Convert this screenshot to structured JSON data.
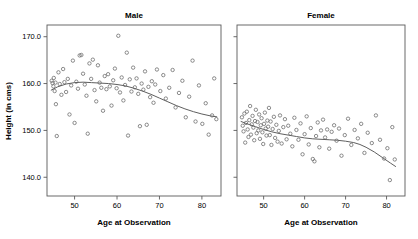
{
  "chart_data": {
    "type": "scatter",
    "title": "",
    "xlabel": "Age at Observation",
    "ylabel": "Height (in cms)",
    "xlim": [
      43.5,
      84.5
    ],
    "ylim": [
      136.0,
      172.5
    ],
    "xticks": [
      50,
      60,
      70,
      80
    ],
    "xtick_labels": [
      "50",
      "60",
      "70",
      "80"
    ],
    "yticks": [
      140.0,
      150.0,
      160.0,
      170.0
    ],
    "ytick_labels": [
      "140.0",
      "150.0",
      "160.0",
      "170.0"
    ],
    "grid": false,
    "legend": "none",
    "marker": "open-circle",
    "marker_color": "#6e6e6e",
    "trend_color": "#5f5f5f",
    "frame_color": "#5a5a5a",
    "panels": [
      {
        "name": "male",
        "label": "Male",
        "show_y_tick_labels": true,
        "points": [
          [
            44.6,
            160.6
          ],
          [
            44.8,
            160.1
          ],
          [
            45.0,
            159.4
          ],
          [
            45.1,
            161.2
          ],
          [
            45.3,
            158.4
          ],
          [
            45.5,
            160.2
          ],
          [
            45.6,
            155.6
          ],
          [
            45.8,
            148.8
          ],
          [
            46.2,
            162.4
          ],
          [
            46.5,
            159.9
          ],
          [
            46.9,
            157.6
          ],
          [
            47.3,
            163.1
          ],
          [
            47.6,
            160.3
          ],
          [
            48.0,
            158.2
          ],
          [
            48.4,
            161.0
          ],
          [
            48.8,
            153.4
          ],
          [
            49.2,
            159.6
          ],
          [
            49.6,
            164.9
          ],
          [
            50.0,
            151.6
          ],
          [
            50.4,
            160.4
          ],
          [
            50.8,
            158.9
          ],
          [
            51.2,
            166.0
          ],
          [
            51.6,
            166.1
          ],
          [
            52.0,
            162.1
          ],
          [
            52.4,
            159.8
          ],
          [
            52.8,
            157.4
          ],
          [
            53.1,
            149.3
          ],
          [
            53.5,
            164.3
          ],
          [
            53.9,
            161.0
          ],
          [
            54.3,
            165.1
          ],
          [
            54.7,
            158.6
          ],
          [
            55.1,
            156.2
          ],
          [
            55.5,
            163.9
          ],
          [
            55.9,
            160.2
          ],
          [
            56.3,
            159.1
          ],
          [
            56.7,
            154.2
          ],
          [
            57.1,
            161.6
          ],
          [
            57.5,
            158.8
          ],
          [
            57.9,
            162.0
          ],
          [
            58.3,
            159.4
          ],
          [
            58.7,
            155.3
          ],
          [
            59.1,
            160.7
          ],
          [
            59.5,
            163.2
          ],
          [
            59.9,
            159.0
          ],
          [
            60.3,
            170.2
          ],
          [
            60.7,
            158.1
          ],
          [
            61.1,
            161.3
          ],
          [
            61.5,
            156.4
          ],
          [
            61.9,
            159.7
          ],
          [
            62.3,
            166.6
          ],
          [
            62.6,
            148.9
          ],
          [
            63.0,
            160.9
          ],
          [
            63.4,
            158.3
          ],
          [
            63.8,
            163.4
          ],
          [
            64.2,
            159.2
          ],
          [
            64.6,
            161.1
          ],
          [
            65.0,
            157.8
          ],
          [
            65.4,
            150.9
          ],
          [
            65.8,
            160.0
          ],
          [
            66.2,
            158.7
          ],
          [
            66.6,
            162.6
          ],
          [
            67.0,
            151.2
          ],
          [
            67.4,
            159.3
          ],
          [
            67.8,
            157.1
          ],
          [
            68.2,
            160.5
          ],
          [
            68.6,
            155.9
          ],
          [
            69.0,
            159.8
          ],
          [
            69.4,
            163.0
          ],
          [
            70.2,
            158.4
          ],
          [
            70.9,
            161.8
          ],
          [
            71.5,
            156.8
          ],
          [
            72.3,
            159.1
          ],
          [
            73.1,
            162.9
          ],
          [
            73.8,
            154.9
          ],
          [
            74.6,
            158.0
          ],
          [
            75.4,
            160.6
          ],
          [
            76.2,
            152.8
          ],
          [
            77.0,
            157.2
          ],
          [
            77.8,
            164.9
          ],
          [
            78.5,
            151.9
          ],
          [
            79.3,
            159.6
          ],
          [
            80.1,
            151.4
          ],
          [
            80.9,
            155.8
          ],
          [
            81.6,
            149.1
          ],
          [
            82.4,
            153.2
          ],
          [
            82.9,
            161.1
          ],
          [
            83.4,
            152.4
          ]
        ],
        "trend": [
          [
            44.5,
            158.6
          ],
          [
            46.0,
            159.3
          ],
          [
            48.0,
            159.9
          ],
          [
            50.0,
            160.2
          ],
          [
            52.0,
            160.3
          ],
          [
            54.0,
            160.2
          ],
          [
            56.0,
            160.1
          ],
          [
            58.0,
            160.0
          ],
          [
            60.0,
            159.8
          ],
          [
            62.0,
            159.5
          ],
          [
            64.0,
            159.0
          ],
          [
            66.0,
            158.4
          ],
          [
            68.0,
            157.7
          ],
          [
            70.0,
            156.9
          ],
          [
            72.0,
            156.1
          ],
          [
            74.0,
            155.3
          ],
          [
            76.0,
            154.6
          ],
          [
            78.0,
            154.0
          ],
          [
            80.0,
            153.5
          ],
          [
            82.0,
            153.1
          ],
          [
            83.5,
            152.9
          ]
        ]
      },
      {
        "name": "female",
        "label": "Female",
        "show_y_tick_labels": false,
        "points": [
          [
            44.7,
            152.8
          ],
          [
            44.9,
            151.0
          ],
          [
            45.1,
            149.8
          ],
          [
            45.3,
            153.6
          ],
          [
            45.5,
            147.4
          ],
          [
            45.7,
            151.6
          ],
          [
            45.9,
            154.0
          ],
          [
            46.1,
            150.2
          ],
          [
            46.3,
            148.6
          ],
          [
            46.5,
            152.2
          ],
          [
            46.7,
            155.2
          ],
          [
            46.9,
            149.1
          ],
          [
            47.1,
            151.3
          ],
          [
            47.3,
            153.1
          ],
          [
            47.5,
            150.6
          ],
          [
            47.7,
            147.9
          ],
          [
            47.9,
            152.0
          ],
          [
            48.1,
            154.4
          ],
          [
            48.3,
            149.4
          ],
          [
            48.5,
            151.8
          ],
          [
            48.7,
            150.0
          ],
          [
            48.9,
            153.4
          ],
          [
            49.1,
            148.2
          ],
          [
            49.3,
            151.1
          ],
          [
            49.5,
            152.6
          ],
          [
            49.7,
            149.6
          ],
          [
            49.9,
            147.1
          ],
          [
            50.1,
            151.4
          ],
          [
            50.3,
            153.8
          ],
          [
            50.5,
            150.4
          ],
          [
            50.7,
            148.9
          ],
          [
            50.9,
            152.1
          ],
          [
            51.1,
            150.8
          ],
          [
            51.3,
            154.8
          ],
          [
            51.5,
            149.0
          ],
          [
            51.7,
            151.9
          ],
          [
            51.9,
            146.9
          ],
          [
            52.2,
            150.3
          ],
          [
            52.5,
            152.9
          ],
          [
            52.8,
            148.4
          ],
          [
            53.1,
            151.2
          ],
          [
            53.4,
            147.6
          ],
          [
            53.7,
            149.9
          ],
          [
            54.0,
            153.2
          ],
          [
            54.4,
            147.2
          ],
          [
            54.8,
            150.7
          ],
          [
            55.2,
            152.4
          ],
          [
            55.6,
            148.1
          ],
          [
            56.0,
            151.0
          ],
          [
            56.5,
            149.3
          ],
          [
            57.0,
            146.6
          ],
          [
            57.5,
            152.7
          ],
          [
            58.0,
            150.1
          ],
          [
            58.5,
            148.0
          ],
          [
            59.0,
            151.5
          ],
          [
            59.5,
            144.9
          ],
          [
            60.0,
            149.2
          ],
          [
            60.5,
            153.0
          ],
          [
            61.0,
            147.0
          ],
          [
            61.5,
            150.5
          ],
          [
            62.0,
            143.9
          ],
          [
            62.4,
            143.4
          ],
          [
            62.8,
            148.8
          ],
          [
            63.2,
            151.7
          ],
          [
            63.6,
            146.4
          ],
          [
            64.0,
            150.0
          ],
          [
            64.5,
            152.3
          ],
          [
            65.0,
            148.5
          ],
          [
            65.5,
            150.2
          ],
          [
            66.0,
            146.1
          ],
          [
            66.6,
            149.7
          ],
          [
            67.2,
            151.1
          ],
          [
            67.8,
            147.8
          ],
          [
            68.4,
            150.4
          ],
          [
            69.0,
            144.6
          ],
          [
            69.8,
            149.0
          ],
          [
            70.6,
            152.5
          ],
          [
            71.4,
            146.9
          ],
          [
            72.2,
            150.1
          ],
          [
            73.0,
            148.3
          ],
          [
            73.8,
            151.4
          ],
          [
            74.6,
            145.2
          ],
          [
            75.4,
            149.5
          ],
          [
            76.4,
            147.3
          ],
          [
            77.4,
            153.2
          ],
          [
            78.4,
            148.0
          ],
          [
            79.4,
            144.0
          ],
          [
            80.2,
            146.2
          ],
          [
            80.8,
            139.4
          ],
          [
            81.4,
            150.7
          ],
          [
            82.0,
            143.8
          ]
        ],
        "trend": [
          [
            44.5,
            151.9
          ],
          [
            46.0,
            151.4
          ],
          [
            48.0,
            150.8
          ],
          [
            50.0,
            150.2
          ],
          [
            52.0,
            149.7
          ],
          [
            54.0,
            149.3
          ],
          [
            56.0,
            149.0
          ],
          [
            58.0,
            148.7
          ],
          [
            60.0,
            148.4
          ],
          [
            62.0,
            148.2
          ],
          [
            64.0,
            148.1
          ],
          [
            66.0,
            148.0
          ],
          [
            68.0,
            147.9
          ],
          [
            70.0,
            147.7
          ],
          [
            72.0,
            147.4
          ],
          [
            73.5,
            147.0
          ],
          [
            75.0,
            146.4
          ],
          [
            77.0,
            145.4
          ],
          [
            79.0,
            144.2
          ],
          [
            81.0,
            143.0
          ],
          [
            82.2,
            142.3
          ]
        ]
      }
    ]
  }
}
